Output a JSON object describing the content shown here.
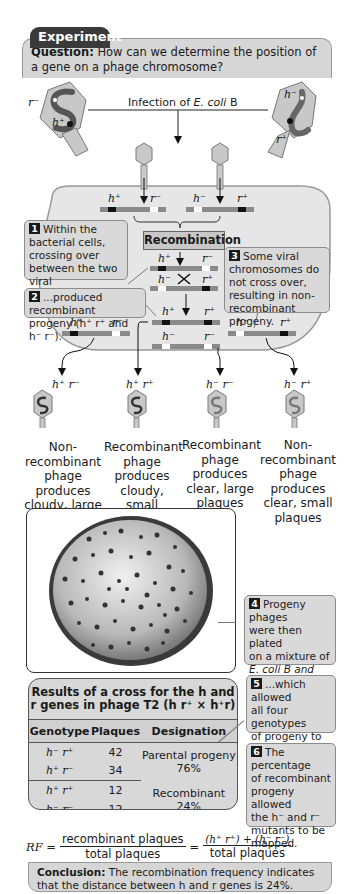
{
  "header": {
    "tab_label": "Experiment",
    "question_label": "Question:",
    "question_text": " How can we determine the position of a gene on a phage chromosome?"
  },
  "infection": {
    "label_prefix": "Infection of ",
    "label_species": "E. coli",
    "label_suffix": " B",
    "parent_left": {
      "gene1": "r⁻",
      "gene2": "h⁺"
    },
    "parent_right": {
      "gene1": "h⁻",
      "gene2": "r⁺"
    }
  },
  "chromosomes": {
    "top_left": {
      "left": "h⁺",
      "right": "r⁻"
    },
    "top_right": {
      "left": "h⁻",
      "right": "r⁺"
    },
    "cross_top": {
      "left": "h⁺",
      "right": "r⁻"
    },
    "cross_bottom": {
      "left": "h⁻",
      "right": "r⁺"
    },
    "recomb_top": {
      "left": "h⁺",
      "right": "r⁺"
    },
    "recomb_bottom": {
      "left": "h⁻",
      "right": "r⁻"
    },
    "nonrecomb_left": {
      "left": "h⁺",
      "right": "r⁻"
    },
    "nonrecomb_right": {
      "left": "h⁻",
      "right": "r⁺"
    }
  },
  "recombination_label": "Recombination",
  "callouts": [
    {
      "num": "1",
      "text": "Within the bacterial cells, crossing over between the two viral chromosomes..."
    },
    {
      "num": "2",
      "text": "...produced recombinant progeny (h⁺ r⁺ and h⁻ r⁻)."
    },
    {
      "num": "3",
      "text": "Some viral chromosomes do not cross over, resulting in non-recombinant progeny."
    },
    {
      "num": "4",
      "text_lines": [
        "Progeny phages",
        "were then plated",
        "on a mixture of",
        "E. coli B and",
        "E. coli B/2 cells,..."
      ]
    },
    {
      "num": "5",
      "text_lines": [
        "...which allowed",
        "all four genotypes",
        "of progeny to",
        "be identified."
      ]
    },
    {
      "num": "6",
      "text_lines": [
        "The percentage",
        "of recombinant",
        "progeny allowed",
        "the h⁻ and r⁻",
        "mutants to be",
        "mapped."
      ]
    }
  ],
  "progeny": [
    {
      "genotype": "h⁺ r⁻",
      "description": [
        "Non-",
        "recombinant",
        "phage produces",
        "cloudy, large",
        "plaques"
      ]
    },
    {
      "genotype": "h⁺ r⁺",
      "description": [
        "Recombinant",
        "phage",
        "produces",
        "cloudy, small",
        "plaques"
      ]
    },
    {
      "genotype": "h⁻ r⁻",
      "description": [
        "Recombinant",
        "phage",
        "produces",
        "clear, large",
        "plaques"
      ]
    },
    {
      "genotype": "h⁻ r⁺",
      "description": [
        "Non-",
        "recombinant",
        "phage produces",
        "clear, small",
        "plaques"
      ]
    }
  ],
  "results_table": {
    "title_line1": "Results of a cross for the h and",
    "title_line2": "r genes in phage T2 (h r⁺ × h⁺r)",
    "headers": [
      "Genotype",
      "Plaques",
      "Designation"
    ],
    "rows": [
      {
        "genotype": "h⁻ r⁺",
        "plaques": "42"
      },
      {
        "genotype": "h⁺ r⁻",
        "plaques": "34"
      },
      {
        "genotype": "h⁺ r⁺",
        "plaques": "12"
      },
      {
        "genotype": "h⁻ r⁻",
        "plaques": "12"
      }
    ],
    "groups": [
      {
        "designation": "Parental progeny",
        "percent": "76%"
      },
      {
        "designation": "Recombinant",
        "percent": "24%"
      }
    ]
  },
  "formula": {
    "lhs": "RF =",
    "num1": "recombinant plaques",
    "den1": "total plaques",
    "eq": "=",
    "num2": "(h⁺ r⁺) + (h⁻ r⁻)",
    "den2": "total plaques"
  },
  "conclusion": {
    "label": "Conclusion:",
    "text": " The recombination frequency indicates that the distance between h and r genes is 24%."
  },
  "colors": {
    "header_dark": "#3a3a3a",
    "panel_gray": "#d6d6d6",
    "cell_fill": "#e6e6e6",
    "phage_fill": "#c8c8c8",
    "chrom_gray": "#8a8a8a"
  }
}
